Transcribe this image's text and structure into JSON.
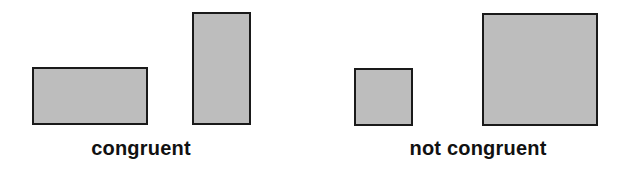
{
  "colors": {
    "fill": "#bdbdbd",
    "stroke": "#1a1a1a",
    "text": "#111111",
    "background": "#ffffff"
  },
  "groups": [
    {
      "label": "congruent",
      "label_center_x": 141,
      "shapes": [
        {
          "kind": "rectangle",
          "orientation": "horizontal",
          "x": 32,
          "y": 67,
          "w": 116,
          "h": 58
        },
        {
          "kind": "rectangle",
          "orientation": "vertical",
          "x": 192,
          "y": 12,
          "w": 59,
          "h": 113
        }
      ]
    },
    {
      "label": "not congruent",
      "label_center_x": 478,
      "shapes": [
        {
          "kind": "square",
          "size": "small",
          "x": 354,
          "y": 68,
          "w": 59,
          "h": 58
        },
        {
          "kind": "square",
          "size": "large",
          "x": 482,
          "y": 13,
          "w": 116,
          "h": 113
        }
      ]
    }
  ]
}
